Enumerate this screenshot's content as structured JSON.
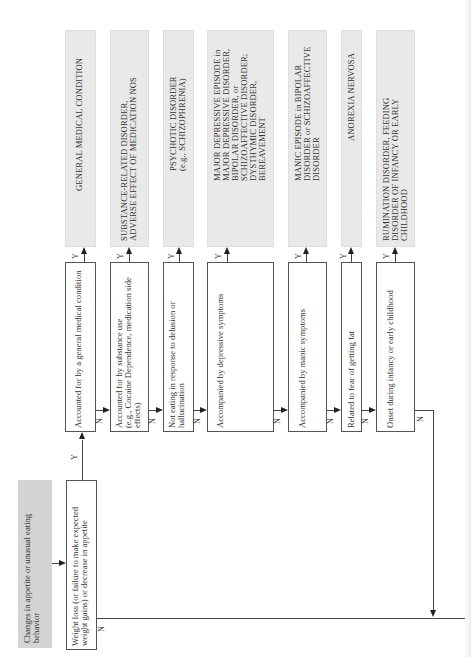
{
  "diagram": {
    "start": {
      "label": "Changes in appetite or unusual eating\nbehavior",
      "fill": "#d4d4d4"
    },
    "entry": {
      "label": "Weight loss (or failure to make expected\nweight gains) or decrease in appetite"
    },
    "decisions": [
      {
        "label": "Accounted for by a general medical condition",
        "yes": "Y",
        "no": "N"
      },
      {
        "label": "Accounted for by substance use\n(e.g., Cocaine Dependence, medication side\neffects)",
        "yes": "Y",
        "no": "N"
      },
      {
        "label": "Not eating in response to delusion or\nhallucination",
        "yes": "Y",
        "no": "N"
      },
      {
        "label": "Accompanied by depressive symptoms",
        "yes": "Y",
        "no": "N"
      },
      {
        "label": "Accompanied by manic symptoms",
        "yes": "Y",
        "no": "N"
      },
      {
        "label": "Related to fear of getting fat",
        "yes": "Y",
        "no": "N"
      },
      {
        "label": "Onset during infancy or early childhood",
        "yes": "Y",
        "no": "N"
      }
    ],
    "outcomes": [
      {
        "label": "GENERAL MEDICAL CONDITION"
      },
      {
        "label": "SUBSTANCE-RELATED DISORDER,\nADVERSE EFFECT OF MEDICATION NOS"
      },
      {
        "label": "PSYCHOTIC DISORDER\n(e.g., SCHIZOPHRENIA)"
      },
      {
        "label": "MAJOR DEPRESSIVE EPISODE in\nMAJOR DEPRESSIVE DISORDER,\nBIPOLAR DISORDER, or\nSCHIZOAFFECTIVE DISORDER;\nDYSTHYMIC DISORDER,\nBEREAVEMENT"
      },
      {
        "label": "MANIC EPISODE in BIPOLAR\nDISORDER or SCHIZOAFFECTIVE\nDISORDER"
      },
      {
        "label": "ANOREXIA NERVOSA"
      },
      {
        "label": "RUMINATION DISORDER, FEEDING\nDISORDER OF INFANCY OR EARLY\nCHILDHOOD"
      }
    ],
    "entry_no_label": "N",
    "entry_yes_label": "Y",
    "colors": {
      "outcome_fill": "#e9e9e9",
      "decision_border": "#555555",
      "line": "#444444"
    }
  }
}
